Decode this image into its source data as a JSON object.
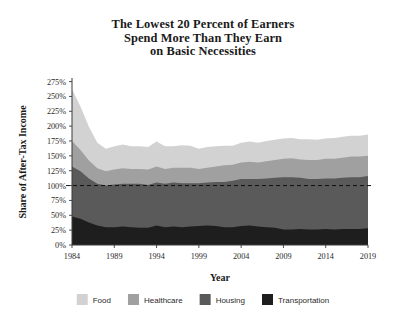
{
  "chart_data": {
    "type": "area",
    "title": "The Lowest 20 Percent of Earners Spend More Than They Earn on Basic Necessities",
    "title_lines": [
      "The Lowest 20 Percent of Earners",
      "Spend More Than They Earn",
      "on Basic Necessities"
    ],
    "xlabel": "Year",
    "ylabel": "Share of After-Tax Income",
    "stacked": true,
    "grid": false,
    "legend_position": "bottom",
    "ylim": [
      0,
      281
    ],
    "xlim": [
      1984,
      2019
    ],
    "ytick_labels": [
      "0%",
      "25%",
      "50%",
      "75%",
      "100%",
      "125%",
      "150%",
      "175%",
      "200%",
      "225%",
      "250%",
      "275%"
    ],
    "ytick_values": [
      0,
      25,
      50,
      75,
      100,
      125,
      150,
      175,
      200,
      225,
      250,
      275
    ],
    "xtick_labels": [
      "1984",
      "1989",
      "1994",
      "1999",
      "2004",
      "2009",
      "2014",
      "2019"
    ],
    "xtick_values": [
      1984,
      1989,
      1994,
      1999,
      2004,
      2009,
      2014,
      2019
    ],
    "reference_line": {
      "value": 100,
      "style": "dashed",
      "label": "100%"
    },
    "x": [
      1984,
      1985,
      1986,
      1987,
      1988,
      1989,
      1990,
      1991,
      1992,
      1993,
      1994,
      1995,
      1996,
      1997,
      1998,
      1999,
      2000,
      2001,
      2002,
      2003,
      2004,
      2005,
      2006,
      2007,
      2008,
      2009,
      2010,
      2011,
      2012,
      2013,
      2014,
      2015,
      2016,
      2017,
      2018,
      2019
    ],
    "series": [
      {
        "name": "Transportation",
        "color": "#1e1e1e",
        "values": [
          48,
          44,
          38,
          33,
          30,
          30,
          31,
          30,
          29,
          29,
          33,
          30,
          31,
          30,
          31,
          32,
          33,
          32,
          30,
          30,
          32,
          33,
          31,
          30,
          29,
          26,
          26,
          27,
          26,
          26,
          27,
          26,
          27,
          27,
          27,
          28
        ]
      },
      {
        "name": "Housing",
        "color": "#5a5a5a",
        "values": [
          84,
          80,
          74,
          70,
          70,
          72,
          72,
          73,
          74,
          72,
          72,
          73,
          74,
          74,
          73,
          72,
          72,
          74,
          76,
          78,
          79,
          78,
          80,
          82,
          84,
          88,
          88,
          86,
          85,
          85,
          85,
          86,
          86,
          87,
          87,
          88
        ]
      },
      {
        "name": "Healthcare",
        "color": "#a0a0a0",
        "values": [
          43,
          36,
          30,
          26,
          24,
          25,
          26,
          25,
          25,
          26,
          27,
          25,
          25,
          26,
          26,
          24,
          25,
          26,
          28,
          27,
          28,
          29,
          28,
          29,
          30,
          31,
          32,
          31,
          32,
          32,
          33,
          33,
          34,
          35,
          35,
          34
        ]
      },
      {
        "name": "Food",
        "color": "#d2d2d2",
        "values": [
          87,
          73,
          57,
          43,
          38,
          39,
          40,
          38,
          38,
          38,
          42,
          38,
          36,
          38,
          37,
          34,
          35,
          34,
          33,
          32,
          33,
          34,
          33,
          34,
          34,
          34,
          34,
          34,
          35,
          34,
          34,
          35,
          35,
          35,
          35,
          36
        ]
      }
    ],
    "totals": [
      262,
      233,
      199,
      172,
      162,
      166,
      169,
      166,
      166,
      165,
      174,
      166,
      166,
      168,
      167,
      162,
      165,
      166,
      167,
      167,
      172,
      174,
      172,
      175,
      177,
      179,
      180,
      178,
      178,
      177,
      179,
      180,
      182,
      184,
      184,
      186
    ]
  },
  "legend": {
    "items": [
      {
        "label": "Food",
        "color": "#d2d2d2"
      },
      {
        "label": "Healthcare",
        "color": "#a0a0a0"
      },
      {
        "label": "Housing",
        "color": "#5a5a5a"
      },
      {
        "label": "Transportation",
        "color": "#1e1e1e"
      }
    ]
  }
}
